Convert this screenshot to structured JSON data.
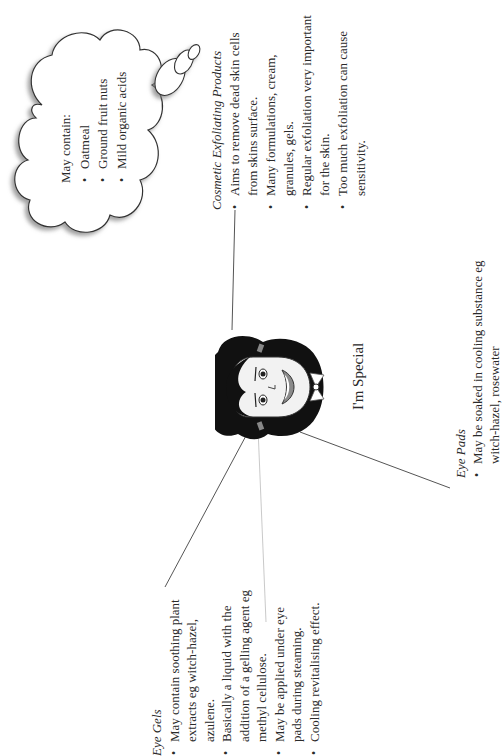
{
  "document": {
    "orientation": "rotated-90-ccw",
    "center_label": "I'm Special"
  },
  "cloud": {
    "intro": "May contain:",
    "items": [
      "Oatmeal",
      "Ground fruit nuts",
      "Mild organic acids"
    ]
  },
  "exfoliating": {
    "title": "Cosmetic Exfoliating Products",
    "items": [
      [
        "Aims to remove dead skin cells",
        "from skins surface."
      ],
      [
        "Many formulations, cream,",
        "granules, gels."
      ],
      [
        "Regular exfoliation very important",
        "for the skin."
      ],
      [
        "Too much exfoliation can cause",
        "sensitivity."
      ]
    ]
  },
  "eye_gels": {
    "title": "Eye Gels",
    "items": [
      [
        "May contain soothing plant",
        "extracts eg witch-hazel,",
        "azulene."
      ],
      [
        "Basically a liquid with the",
        "addition of a gelling agent eg",
        "methyl cellulose."
      ],
      [
        "May be applied under eye",
        "pads during steaming."
      ],
      [
        "Cooling revitalising effect."
      ]
    ]
  },
  "eye_pads": {
    "title": "Eye Pads",
    "items": [
      [
        "May be soaked in cooling substance eg",
        "witch-hazel, rosewater"
      ]
    ]
  },
  "illustration": {
    "subject": "cartoon-face-with-bow",
    "colors": {
      "hair": "#111111",
      "skin": "#f2f2f2",
      "lips": "#8a8a8a",
      "outline": "#333333"
    }
  },
  "colors": {
    "text": "#2a2a2a",
    "line": "#555555",
    "background": "#ffffff"
  }
}
